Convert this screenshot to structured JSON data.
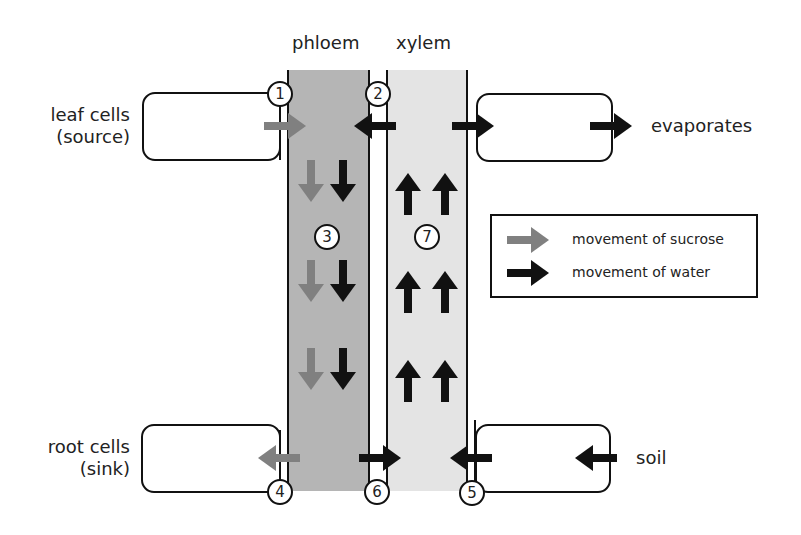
{
  "diagram": {
    "columns": {
      "phloem": "phloem",
      "xylem": "xylem"
    },
    "cells": {
      "leaf": {
        "line1": "leaf cells",
        "line2": "(source)"
      },
      "root": {
        "line1": "root cells",
        "line2": "(sink)"
      }
    },
    "outputs": {
      "evaporates": "evaporates",
      "soil": "soil"
    },
    "markers": [
      "1",
      "2",
      "3",
      "4",
      "5",
      "6",
      "7"
    ],
    "legend": {
      "sucrose": "movement of sucrose",
      "water": "movement of water"
    },
    "colors": {
      "phloem_fill": "#b5b5b5",
      "xylem_fill": "#e4e4e4",
      "sucrose_arrow": "#808080",
      "water_arrow": "#111111"
    }
  }
}
